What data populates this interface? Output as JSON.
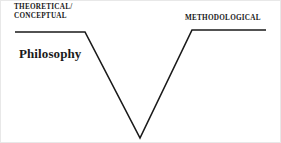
{
  "figure": {
    "background_color": "#ffffff",
    "line_color": "#1a1a1a",
    "text_color": "#1a1a1a"
  },
  "labels": {
    "theoretical_line1": "THEORETICAL/",
    "theoretical_line2": "CONCEPTUAL",
    "methodological": "METHODOLOGICAL",
    "philosophy": "Philosophy"
  },
  "diagram_data": {
    "type": "line",
    "shape": "v-shape",
    "points": [
      {
        "x": 14,
        "y": 31
      },
      {
        "x": 84,
        "y": 31
      },
      {
        "x": 139,
        "y": 137
      },
      {
        "x": 191,
        "y": 29
      },
      {
        "x": 265,
        "y": 29
      }
    ],
    "stroke_width": 1.6
  }
}
